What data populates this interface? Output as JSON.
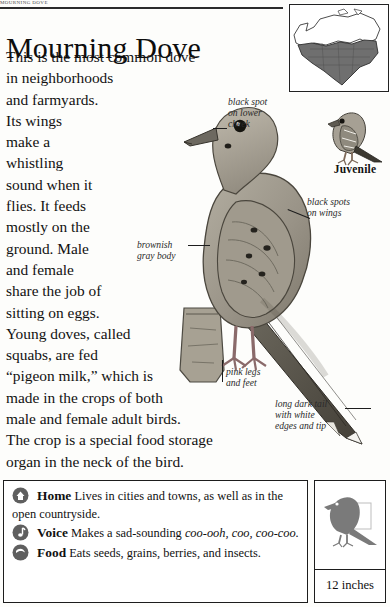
{
  "running_head": "MOURNING DOVE",
  "title": "Mourning Dove",
  "body_lines": [
    "This is the most common dove",
    "in neighborhoods",
    "and farmyards.",
    "Its wings",
    "make a",
    "whistling",
    "sound when it",
    "flies. It feeds",
    "mostly on the",
    "ground. Male",
    "and female",
    "share the job of",
    "sitting on eggs.",
    "Young doves, called",
    "squabs, are fed",
    "“pigeon milk,” which is",
    "made in the crops of both",
    "male and female adult birds.",
    "The crop is a special food storage",
    "organ in the neck of the bird."
  ],
  "callouts": {
    "cheek": [
      "black spot",
      "on lower",
      "cheek"
    ],
    "wings": [
      "black spots",
      "on wings"
    ],
    "body": [
      "brownish",
      "gray body"
    ],
    "legs": [
      "pink legs",
      "and feet"
    ],
    "tail": [
      "long dark tail",
      "with white",
      "edges and tip"
    ]
  },
  "juvenile": {
    "label": "Juvenile",
    "icon": "juvenile-dove-illustration"
  },
  "range_map": {
    "icon": "north-america-range-map"
  },
  "facts": [
    {
      "icon": "home-icon",
      "key": "Home",
      "text": "Lives in cities and towns, as well as in the open countryside.",
      "emphasis": ""
    },
    {
      "icon": "voice-note-icon",
      "key": "Voice",
      "text_before": "Makes a sad-sounding ",
      "emphasis": "coo-ooh, coo, coo-coo.",
      "text_after": ""
    },
    {
      "icon": "food-seed-icon",
      "key": "Food",
      "text": "Eats seeds, grains, berries, and insects.",
      "emphasis": ""
    }
  ],
  "size_box": {
    "icon": "dove-silhouette",
    "measurement": "12 inches"
  },
  "colors": {
    "ink": "#111111",
    "rule": "#2b2b2b",
    "bird_body": "#9a9588",
    "bird_dark": "#3d3a33",
    "map_shade": "#6f6f6f",
    "paper": "#fdfdfb"
  }
}
